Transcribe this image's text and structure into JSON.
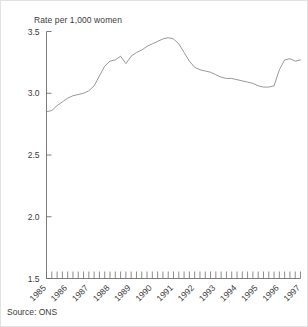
{
  "figure": {
    "source_note": "Source:  ONS",
    "background_color": "#ffffff",
    "line_color": "#8c8c8c",
    "axis_color": "#6e6e6e",
    "text_color": "#3b3b3b"
  },
  "chart_data": {
    "type": "line",
    "title": "",
    "ylabel": "Rate per 1,000 women",
    "xlabel": "",
    "ylim": [
      1.5,
      3.5
    ],
    "ytick_labels": [
      "1.5",
      "2.0",
      "2.5",
      "3.0",
      "3.5"
    ],
    "ytick_values": [
      1.5,
      2.0,
      2.5,
      3.0,
      3.5
    ],
    "xlim": [
      "1985 Q1",
      "1997 Q1"
    ],
    "xtick_labels": [
      "1985",
      "1986",
      "1987",
      "1988",
      "1989",
      "1990",
      "1991",
      "1992",
      "1993",
      "1994",
      "1995",
      "1996",
      "1997"
    ],
    "minor_ticks_per_year": 4,
    "grid": false,
    "legend": false,
    "series": [
      {
        "name": "Rate per 1,000 women",
        "x": [
          "1985 Q1",
          "1985 Q2",
          "1985 Q3",
          "1985 Q4",
          "1986 Q1",
          "1986 Q2",
          "1986 Q3",
          "1986 Q4",
          "1987 Q1",
          "1987 Q2",
          "1987 Q3",
          "1987 Q4",
          "1988 Q1",
          "1988 Q2",
          "1988 Q3",
          "1988 Q4",
          "1989 Q1",
          "1989 Q2",
          "1989 Q3",
          "1989 Q4",
          "1990 Q1",
          "1990 Q2",
          "1990 Q3",
          "1990 Q4",
          "1991 Q1",
          "1991 Q2",
          "1991 Q3",
          "1991 Q4",
          "1992 Q1",
          "1992 Q2",
          "1992 Q3",
          "1992 Q4",
          "1993 Q1",
          "1993 Q2",
          "1993 Q3",
          "1993 Q4",
          "1994 Q1",
          "1994 Q2",
          "1994 Q3",
          "1994 Q4",
          "1995 Q1",
          "1995 Q2",
          "1995 Q3",
          "1995 Q4",
          "1996 Q1",
          "1996 Q2",
          "1996 Q3",
          "1996 Q4",
          "1997 Q1"
        ],
        "values": [
          2.85,
          2.86,
          2.9,
          2.93,
          2.96,
          2.98,
          2.99,
          3.0,
          3.02,
          3.06,
          3.14,
          3.22,
          3.26,
          3.27,
          3.3,
          3.24,
          3.3,
          3.33,
          3.35,
          3.38,
          3.4,
          3.42,
          3.44,
          3.45,
          3.44,
          3.4,
          3.33,
          3.26,
          3.21,
          3.19,
          3.18,
          3.17,
          3.15,
          3.13,
          3.12,
          3.12,
          3.11,
          3.1,
          3.09,
          3.08,
          3.06,
          3.05,
          3.05,
          3.06,
          3.19,
          3.27,
          3.28,
          3.26,
          3.27
        ]
      }
    ]
  }
}
